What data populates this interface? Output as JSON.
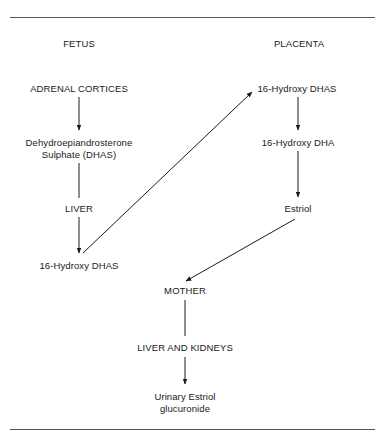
{
  "diagram": {
    "columns": {
      "fetus": "FETUS",
      "placenta": "PLACENTA"
    },
    "fetus_nodes": {
      "adrenal": "ADRENAL CORTICES",
      "dhas_line1": "Dehydroepiandrosterone",
      "dhas_line2": "Sulphate (DHAS)",
      "liver": "LIVER",
      "hydroxy_dhas": "16-Hydroxy DHAS"
    },
    "placenta_nodes": {
      "hydroxy_dhas": "16-Hydroxy DHAS",
      "hydroxy_dha": "16-Hydroxy DHA",
      "estriol": "Estriol"
    },
    "mother_nodes": {
      "mother": "MOTHER",
      "liver_kidneys": "LIVER AND KIDNEYS",
      "urinary_line1": "Urinary Estriol",
      "urinary_line2": "glucuronide"
    },
    "edges": [
      {
        "from": "ADRENAL CORTICES",
        "to": "Dehydroepiandrosterone Sulphate (DHAS)",
        "arrow": true
      },
      {
        "from": "Dehydroepiandrosterone Sulphate (DHAS)",
        "to": "LIVER",
        "arrow": false
      },
      {
        "from": "LIVER",
        "to": "16-Hydroxy DHAS (fetus)",
        "arrow": true
      },
      {
        "from": "16-Hydroxy DHAS (fetus)",
        "to": "16-Hydroxy DHAS (placenta)",
        "arrow": true
      },
      {
        "from": "16-Hydroxy DHAS (placenta)",
        "to": "16-Hydroxy DHA",
        "arrow": true
      },
      {
        "from": "16-Hydroxy DHA",
        "to": "Estriol",
        "arrow": true
      },
      {
        "from": "Estriol",
        "to": "MOTHER",
        "arrow": true
      },
      {
        "from": "MOTHER",
        "to": "LIVER AND KIDNEYS",
        "arrow": false
      },
      {
        "from": "LIVER AND KIDNEYS",
        "to": "Urinary Estriol glucuronide",
        "arrow": true
      }
    ]
  }
}
